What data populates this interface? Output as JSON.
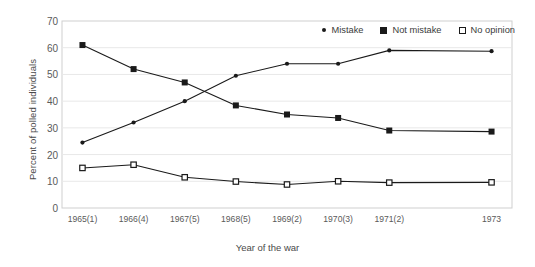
{
  "chart_data": {
    "type": "line",
    "title": "",
    "xlabel": "Year of the war",
    "ylabel": "Percent of polled individuals",
    "categories": [
      "1965(1)",
      "1966(4)",
      "1967(5)",
      "1968(5)",
      "1969(2)",
      "1970(3)",
      "1971(2)",
      "1973"
    ],
    "x": [
      1965,
      1966,
      1967,
      1968,
      1969,
      1970,
      1971,
      1973
    ],
    "xlim": [
      1964.6,
      1973.4
    ],
    "ylim": [
      0,
      70
    ],
    "yticks": [
      0,
      10,
      20,
      30,
      40,
      50,
      60,
      70
    ],
    "grid": true,
    "legend_position": "top-right",
    "series": [
      {
        "name": "Mistake",
        "marker": "filled-circle",
        "color": "#1a1a1a",
        "values": [
          24.5,
          32,
          40,
          49.5,
          54,
          54,
          59,
          58.7
        ]
      },
      {
        "name": "Not mistake",
        "marker": "filled-square",
        "color": "#1a1a1a",
        "values": [
          61,
          52,
          47,
          38.4,
          35,
          33.7,
          29,
          28.6
        ]
      },
      {
        "name": "No opinion",
        "marker": "open-square",
        "color": "#1a1a1a",
        "values": [
          15,
          16.2,
          11.5,
          9.9,
          8.8,
          10,
          9.5,
          9.6
        ]
      }
    ]
  },
  "axis": {
    "y_title": "Percent of polled individuals",
    "x_title": "Year of the war"
  },
  "legend": {
    "items": [
      {
        "label": "Mistake",
        "icon": "filled-circle-marker-icon"
      },
      {
        "label": "Not mistake",
        "icon": "filled-square-marker-icon"
      },
      {
        "label": "No opinion",
        "icon": "open-square-marker-icon"
      }
    ]
  }
}
